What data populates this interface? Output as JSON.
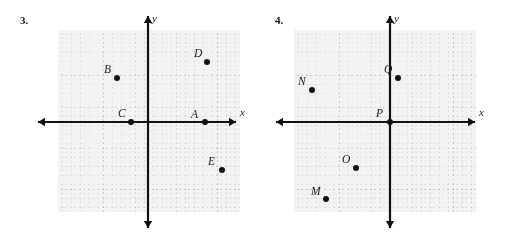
{
  "page": {
    "width": 511,
    "height": 236,
    "background": "#ffffff",
    "ink_color": "#111111",
    "grid_fill": "#f3f3f1",
    "grid_line_color": "#9a9a9f"
  },
  "problems": [
    {
      "id": "problem-3",
      "number_label": "3.",
      "plane": {
        "left": 58,
        "top": 30,
        "width": 182,
        "height": 182,
        "origin_x": 148,
        "origin_y": 122,
        "cell_size": 22.8,
        "subdivisions": 5
      },
      "axes": {
        "x_label": "x",
        "y_label": "y",
        "x_label_pos": {
          "left": 240,
          "top": 106
        },
        "y_label_pos": {
          "left": 152,
          "top": 12
        },
        "x_start": 38,
        "x_end": 236,
        "y_start": 16,
        "y_end": 228
      },
      "points": [
        {
          "name": "A",
          "dot_x": 205,
          "dot_y": 122,
          "label_x": 191,
          "label_y": 108
        },
        {
          "name": "B",
          "dot_x": 117,
          "dot_y": 78,
          "label_x": 104,
          "label_y": 63
        },
        {
          "name": "C",
          "dot_x": 131,
          "dot_y": 122,
          "label_x": 118,
          "label_y": 107
        },
        {
          "name": "D",
          "dot_x": 207,
          "dot_y": 62,
          "label_x": 194,
          "label_y": 47
        },
        {
          "name": "E",
          "dot_x": 222,
          "dot_y": 170,
          "label_x": 208,
          "label_y": 155
        }
      ]
    },
    {
      "id": "problem-4",
      "number_label": "4.",
      "plane": {
        "left": 39,
        "top": 30,
        "width": 182,
        "height": 182,
        "origin_x": 135,
        "origin_y": 122,
        "cell_size": 22.8,
        "subdivisions": 5
      },
      "axes": {
        "x_label": "x",
        "y_label": "y",
        "x_label_pos": {
          "left": 224,
          "top": 106
        },
        "y_label_pos": {
          "left": 139,
          "top": 12
        },
        "x_start": 21,
        "x_end": 220,
        "y_start": 16,
        "y_end": 228
      },
      "points": [
        {
          "name": "M",
          "dot_x": 71,
          "dot_y": 199,
          "label_x": 56,
          "label_y": 185
        },
        {
          "name": "N",
          "dot_x": 57,
          "dot_y": 90,
          "label_x": 43,
          "label_y": 75
        },
        {
          "name": "O",
          "dot_x": 101,
          "dot_y": 168,
          "label_x": 87,
          "label_y": 153
        },
        {
          "name": "P",
          "dot_x": 135,
          "dot_y": 122,
          "label_x": 121,
          "label_y": 107
        },
        {
          "name": "Q",
          "dot_x": 143,
          "dot_y": 78,
          "label_x": 129,
          "label_y": 63
        }
      ]
    }
  ]
}
